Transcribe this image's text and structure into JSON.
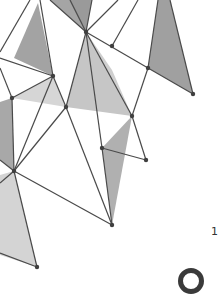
{
  "artwork": {
    "description": "low-poly geometric triangle pattern",
    "colors": {
      "background": "#ffffff",
      "line": "#4a4a4a",
      "node": "#3f3f3f",
      "fill_dark": "#9c9c9c",
      "fill_mid": "#b5b5b5",
      "fill_light": "#d2d2d2"
    }
  },
  "partial_glyph": {
    "text": "1"
  }
}
